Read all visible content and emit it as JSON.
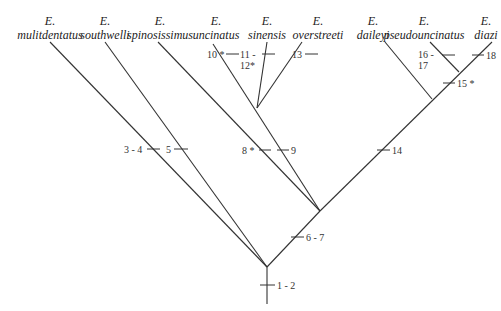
{
  "diagram": {
    "type": "cladogram",
    "taxa": [
      {
        "genus": "E.",
        "species": "mulitdentatus",
        "x": 50
      },
      {
        "genus": "E.",
        "species": "southwelli",
        "x": 105
      },
      {
        "genus": "E.",
        "species": "spinosissimus",
        "x": 160
      },
      {
        "genus": "E.",
        "species": "uncinatus",
        "x": 214
      },
      {
        "genus": "E.",
        "species": "sinensis",
        "x": 267
      },
      {
        "genus": "E.",
        "species": "overstreeti",
        "x": 306
      },
      {
        "genus": "E.",
        "species": "daileyi",
        "x": 369
      },
      {
        "genus": "E.",
        "species": "pseudouncinatus",
        "x": 429
      },
      {
        "genus": "E.",
        "species": "diazi",
        "x": 487
      }
    ],
    "characters": [
      {
        "label": "1 - 2",
        "position": "root stem"
      },
      {
        "label": "3 - 4",
        "position": "mulitdentatus branch"
      },
      {
        "label": "5",
        "position": "southwelli branch"
      },
      {
        "label": "6 - 7",
        "position": "clade (spinosissimus ... diazi)"
      },
      {
        "label": "8 *",
        "position": "spinosissimus branch"
      },
      {
        "label": "9",
        "position": "clade (uncinatus, sinensis, overstreeti)"
      },
      {
        "label": "10 *",
        "position": "uncinatus branch"
      },
      {
        "label": "11 - 12*",
        "position": "sinensis branch"
      },
      {
        "label": "13",
        "position": "overstreeti branch"
      },
      {
        "label": "14",
        "position": "clade (daileyi, pseudouncinatus, diazi)"
      },
      {
        "label": "15 *",
        "position": "clade (pseudouncinatus, diazi)"
      },
      {
        "label": "16 - 17",
        "position": "pseudouncinatus branch"
      },
      {
        "label": "18",
        "position": "diazi branch"
      }
    ]
  }
}
